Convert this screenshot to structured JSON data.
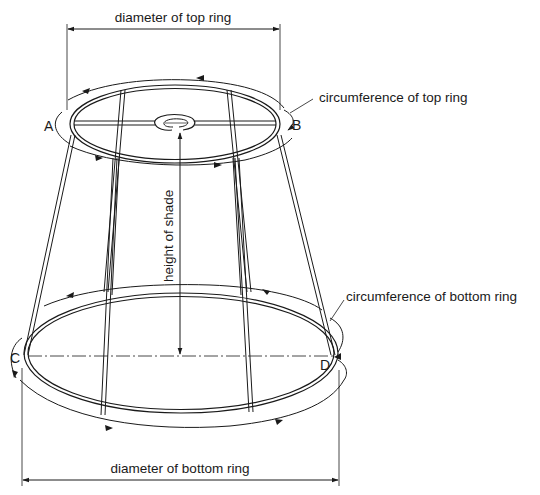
{
  "diagram": {
    "labels": {
      "top_diameter": "diameter of top ring",
      "top_circumference": "circumference of top ring",
      "height": "height of shade",
      "bottom_circumference": "circumference of bottom ring",
      "bottom_diameter": "diameter of bottom ring"
    },
    "points": {
      "a": "A",
      "b": "B",
      "c": "C",
      "d": "D"
    },
    "colors": {
      "line": "#1a1a1a",
      "background": "#ffffff"
    }
  }
}
